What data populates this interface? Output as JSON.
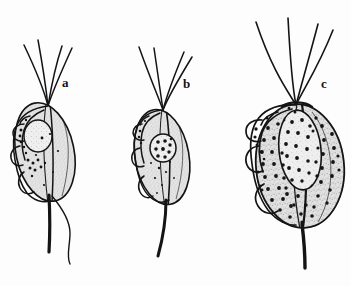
{
  "figure": {
    "type": "scientific-line-drawing",
    "background_color": "#fdfdfd",
    "ink_color": "#141414",
    "cytoplasm_fill": "#d8d8d8",
    "nucleus_fill": "#e8e8e8",
    "width": 351,
    "height": 286,
    "panel_count": 3
  },
  "panels": [
    {
      "id": "a",
      "label": "a",
      "label_x": 62,
      "label_y": 76,
      "anterior_flagella_count": 4,
      "body": {
        "center_x": 45,
        "center_y": 152,
        "radius_x": 29,
        "radius_y": 50,
        "rotation_deg": -12
      },
      "nucleus": {
        "center_x": 38,
        "center_y": 136,
        "radius_x": 14,
        "radius_y": 16,
        "granule_count": 1
      },
      "granule_count": 14,
      "has_undulating_membrane": true,
      "has_axostyle": true,
      "has_trailing_flagellum": true
    },
    {
      "id": "b",
      "label": "b",
      "label_x": 183,
      "label_y": 77,
      "anterior_flagella_count": 4,
      "body": {
        "center_x": 162,
        "center_y": 157,
        "radius_x": 27,
        "radius_y": 48,
        "rotation_deg": -10
      },
      "nucleus": {
        "center_x": 163,
        "center_y": 148,
        "radius_x": 13,
        "radius_y": 14,
        "granule_count": 9
      },
      "granule_count": 8,
      "has_undulating_membrane": true,
      "has_axostyle": true,
      "has_trailing_flagellum": true
    },
    {
      "id": "c",
      "label": "c",
      "label_x": 321,
      "label_y": 77,
      "anterior_flagella_count": 4,
      "body": {
        "center_x": 300,
        "center_y": 166,
        "radius_x": 44,
        "radius_y": 62,
        "rotation_deg": -6
      },
      "nucleus": {
        "center_x": 300,
        "center_y": 150,
        "radius_x": 21,
        "radius_y": 40,
        "granule_count": 22
      },
      "granule_count": 58,
      "has_undulating_membrane": true,
      "has_axostyle": true,
      "has_trailing_flagellum": true
    }
  ],
  "caption": {
    "text": ""
  }
}
